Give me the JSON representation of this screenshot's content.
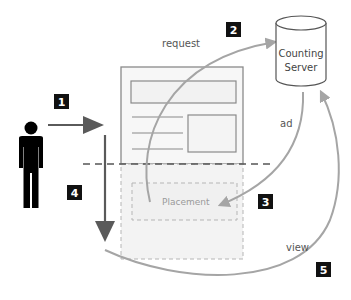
{
  "diagram": {
    "labels": {
      "request": "request",
      "ad": "ad",
      "view": "view",
      "placement": "Placement",
      "server_line1": "Counting",
      "server_line2": "Server"
    },
    "steps": [
      "1",
      "2",
      "3",
      "4",
      "5"
    ],
    "icons": {
      "user": "person-icon",
      "server": "database-cylinder-icon",
      "page": "web-page-icon"
    },
    "colors": {
      "badge": "#111111",
      "arrow_dark": "#5a5a5a",
      "arrow_light": "#9a9a9a",
      "page_border": "#8a8a8a",
      "fold_line": "#555555",
      "below_fold_fill": "#f3f3f3"
    }
  }
}
